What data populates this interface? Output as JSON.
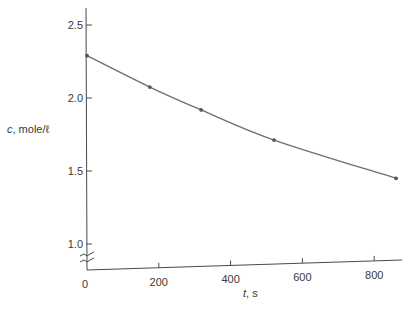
{
  "chart_data": {
    "type": "line",
    "title": "",
    "xlabel_var": "t",
    "xlabel_unit": ", s",
    "ylabel_var": "c",
    "ylabel_unit": ", mole/ℓ",
    "xlim": [
      0,
      900
    ],
    "ylim": [
      0.9,
      2.6
    ],
    "y_axis_break": true,
    "grid": false,
    "legend": null,
    "x_ticks": [
      0,
      200,
      400,
      600,
      800
    ],
    "x_tick_labels": [
      "0",
      "200",
      "400",
      "600",
      "800"
    ],
    "y_ticks": [
      1.0,
      1.5,
      2.0,
      2.5
    ],
    "y_tick_labels": [
      "1.0",
      "1.5",
      "2.0",
      "2.5"
    ],
    "series": [
      {
        "name": "concentration",
        "markers": true,
        "smooth_curve": true,
        "x": [
          0,
          175,
          318,
          521,
          861
        ],
        "y": [
          2.29,
          2.075,
          1.918,
          1.712,
          1.45
        ]
      }
    ]
  },
  "layout": {
    "origin_px": [
      87,
      270
    ],
    "x_px_per_unit": 0.359,
    "y_ref_value": 2.0,
    "y_ref_px": 98,
    "y_px_per_unit": 146,
    "x_axis_end_px": 402,
    "y_axis_top_px": 8
  }
}
